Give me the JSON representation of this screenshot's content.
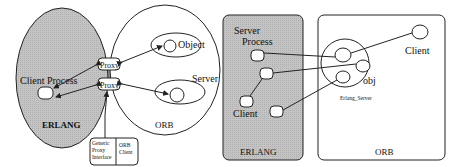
{
  "left_diagram": {
    "erlang_label": "ERLANG",
    "orb_label": "ORB",
    "client_process_label": "Client Process",
    "proxy_top_label": "Proxy",
    "proxy_bottom_label": "Proxy",
    "object_label": "Object",
    "server_label": "Server",
    "legend": {
      "left_lines": [
        "Generic",
        "Proxy",
        "Interface"
      ],
      "right_lines": [
        "ORB",
        "Client"
      ]
    }
  },
  "right_diagram": {
    "erlang_label": "ERLANG",
    "orb_label": "ORB",
    "server_process_label_line1": "Server",
    "server_process_label_line2": "Process",
    "client_erlang_label": "Client",
    "client_orb_label": "Client",
    "obj_label": "obj",
    "erlang_server_label": "Erlang_Server"
  },
  "colors": {
    "erlang_fill": "#c8c8c8",
    "stroke": "#222222",
    "node_fill": "#ffffff"
  }
}
